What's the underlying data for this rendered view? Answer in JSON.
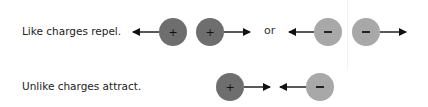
{
  "rows": [
    {
      "label": "Like charges repel."
    },
    {
      "label": "Unlike charges attract."
    }
  ],
  "connector": "or",
  "charges": {
    "positive_symbol": "+",
    "negative_symbol": "−",
    "positive_color": "#6e6e6e",
    "negative_color": "#a8a8a8"
  }
}
